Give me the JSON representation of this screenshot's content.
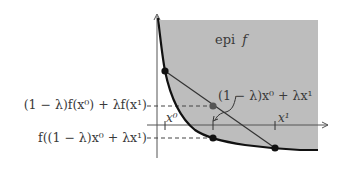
{
  "diagram": {
    "region_label_prefix": "epi",
    "region_label_var": "f",
    "chord_point_label": "(1 − λ)x⁰ + λx¹",
    "left_label_upper": "(1 − λ)f(x⁰) + λf(x¹)",
    "left_label_lower": "f((1 − λ)x⁰ + λx¹)",
    "x_tick_labels": {
      "x0": "x⁰",
      "x1": "x¹"
    },
    "colors": {
      "epigraph_fill": "#bdbdbd",
      "curve": "#111111",
      "axis": "#555555",
      "chord": "#333333",
      "mid_point": "#555555",
      "points": "#111111"
    }
  }
}
